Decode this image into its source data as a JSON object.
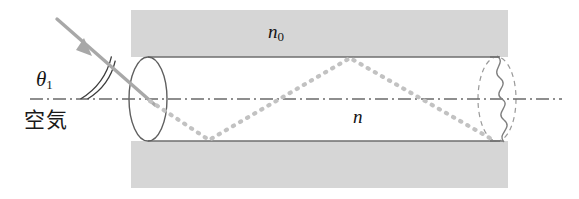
{
  "figure": {
    "kind": "optical-fiber-ray-diagram",
    "width": 579,
    "height": 199,
    "background_color": "#ffffff"
  },
  "labels": {
    "cladding_index": "n",
    "cladding_index_sub": "0",
    "core_index": "n",
    "incidence_angle": "θ",
    "incidence_angle_sub": "1",
    "air_medium": "空気"
  },
  "colors": {
    "cladding_fill": "#d6d6d6",
    "tube_outline": "#6e6e6e",
    "axis_line": "#6a6a6a",
    "incident_ray": "#a8a8a8",
    "internal_ray": "#c2c2c2",
    "break_line": "#8a8a8a",
    "dashed_ellipse": "#9a9a9a",
    "text": "#141414"
  },
  "geometry": {
    "cladding_rect": {
      "x": 131,
      "y": 10,
      "width": 377,
      "height": 178
    },
    "tube_top_y": 57,
    "tube_bottom_y": 141,
    "tube_left_x": 148,
    "tube_right_x": 497,
    "axis_y": 99,
    "axis_start_x": 30,
    "axis_end_x": 562,
    "left_ellipse": {
      "cx": 148,
      "cy": 99,
      "rx": 19,
      "ry": 42
    },
    "right_ellipse": {
      "cx": 497,
      "cy": 99,
      "rx": 19,
      "ry": 42
    },
    "incident_ray": {
      "x1": 57,
      "y1": 19,
      "x2": 152,
      "y2": 102
    },
    "arrowhead": {
      "x": 86,
      "y": 50
    },
    "angle_arcs": {
      "cx": 148,
      "cy": 99,
      "r_outer": 68,
      "r_inner": 61
    }
  },
  "ray_path": {
    "description": "total internal reflection zigzag inside fiber core",
    "points": [
      {
        "x": 150,
        "y": 101
      },
      {
        "x": 209,
        "y": 140
      },
      {
        "x": 350,
        "y": 58
      },
      {
        "x": 495,
        "y": 141
      }
    ]
  },
  "annotations": {
    "break_symbol": "wavy-break",
    "ray_style": "dotted",
    "axis_style": "dash-dot"
  }
}
